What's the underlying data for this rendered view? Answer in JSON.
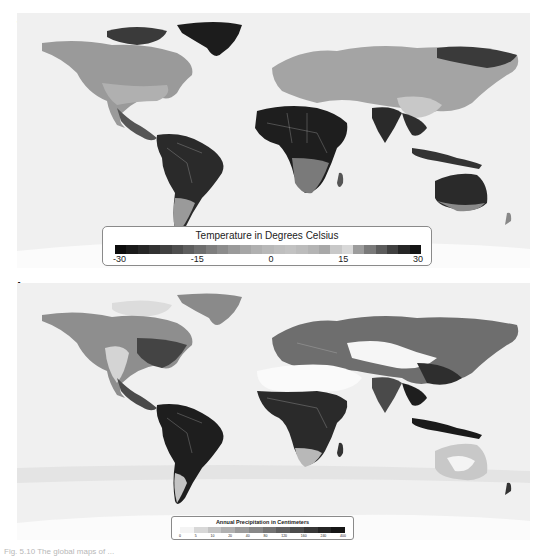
{
  "figure": {
    "panels": [
      {
        "label": "a",
        "variable": "temperature",
        "legend": {
          "title": "Temperature in Degrees Celsius",
          "ticks": [
            "-30",
            "-15",
            "0",
            "15",
            "30"
          ],
          "ramp": [
            "#0c0c0c",
            "#1a1a1a",
            "#262626",
            "#323232",
            "#404040",
            "#4e4e4e",
            "#5e5e5e",
            "#6e6e6e",
            "#7e7e7e",
            "#8c8c8c",
            "#9a9a9a",
            "#a6a6a6",
            "#b0b0b0",
            "#b8b8b8",
            "#bebebe",
            "#c2c2c2",
            "#bcbcbc",
            "#b4b4b4",
            "#a8a8a8",
            "#c8c8c8",
            "#d8d8d8",
            "#9c9c9c",
            "#7a7a7a",
            "#5c5c5c",
            "#404040",
            "#262626",
            "#141414"
          ]
        }
      },
      {
        "label": "b",
        "variable": "precipitation",
        "legend": {
          "title": "Annual Precipitation in Centimeters",
          "ticks": [
            "0",
            "5",
            "10",
            "20",
            "40",
            "80",
            "120",
            "160",
            "240",
            "400"
          ],
          "ramp": [
            "#f4f4f4",
            "#d8d8d8",
            "#c4c4c4",
            "#b0b0b0",
            "#9c9c9c",
            "#888888",
            "#747474",
            "#606060",
            "#4c4c4c",
            "#383838",
            "#262626",
            "#161616"
          ]
        }
      }
    ],
    "caption": "Fig. 5.10  The global maps of ..."
  },
  "chart_data": [
    {
      "type": "heatmap",
      "title": "Temperature in Degrees Celsius",
      "panel": "a",
      "legend_range": [
        -30,
        30
      ],
      "legend_ticks": [
        -30,
        -15,
        0,
        15,
        30
      ],
      "legend_position": "bottom-center",
      "description": "Global map of mean annual temperature; darkest tones in tropics (Amazon, Central Africa, India, Australia) and in Greenland/Siberia at the cold extreme."
    },
    {
      "type": "heatmap",
      "title": "Annual Precipitation in Centimeters",
      "panel": "b",
      "legend_ticks": [
        0,
        5,
        10,
        20,
        40,
        80,
        120,
        160,
        240,
        400
      ],
      "legend_position": "bottom-center",
      "description": "Global map of annual precipitation; darkest in Amazon, Central Africa, Southeast Asia, Indonesia; white in Sahara, Arabia, Central Asian deserts, central Australia."
    }
  ]
}
